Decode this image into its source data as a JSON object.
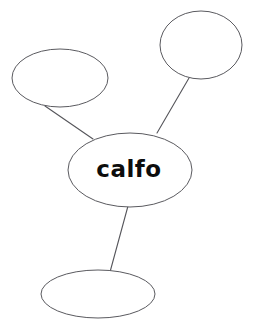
{
  "diagram": {
    "type": "concept-map",
    "background_color": "#ffffff",
    "stroke_color": "#5a5a5f",
    "text_color": "#0d0d0d",
    "center_node": {
      "label": "calfo",
      "cx": 130,
      "cy": 170,
      "rx": 62,
      "ry": 37,
      "label_x": 129,
      "label_y": 170
    },
    "branch_nodes": [
      {
        "name": "top-left-node",
        "label": "",
        "cx": 60,
        "cy": 78,
        "rx": 48,
        "ry": 29
      },
      {
        "name": "top-right-node",
        "label": "",
        "cx": 201,
        "cy": 45,
        "rx": 41,
        "ry": 34
      },
      {
        "name": "bottom-node",
        "label": "",
        "cx": 98,
        "cy": 294,
        "rx": 57,
        "ry": 24
      }
    ],
    "connectors": [
      {
        "name": "connector-top-left",
        "x1": 45,
        "y1": 106,
        "x2": 93,
        "y2": 139
      },
      {
        "name": "connector-top-right",
        "x1": 189,
        "y1": 78,
        "x2": 157,
        "y2": 133
      },
      {
        "name": "connector-bottom",
        "x1": 128,
        "y1": 206,
        "x2": 110,
        "y2": 272
      }
    ]
  }
}
